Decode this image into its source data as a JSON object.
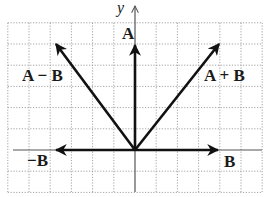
{
  "diagram": {
    "type": "vector-addition-grid",
    "axis_label_y": "y",
    "origin": [
      0,
      0
    ],
    "grid": {
      "x_range": [
        -6,
        6
      ],
      "y_range": [
        -2,
        6
      ],
      "step": 1
    },
    "vectors": [
      {
        "id": "A",
        "label": "A",
        "components": [
          0,
          5
        ]
      },
      {
        "id": "B",
        "label": "B",
        "components": [
          4,
          0
        ]
      },
      {
        "id": "neg-B",
        "label": "−B",
        "components": [
          -4,
          0
        ]
      },
      {
        "id": "A-plus-B",
        "label": "A + B",
        "components": [
          4,
          5
        ]
      },
      {
        "id": "A-minus-B",
        "label": "A − B",
        "components": [
          -4,
          5
        ]
      }
    ],
    "colors": {
      "grid": "#9a9a9a",
      "axis": "#555555",
      "vector": "#111111",
      "text": "#1a1a1a"
    }
  }
}
